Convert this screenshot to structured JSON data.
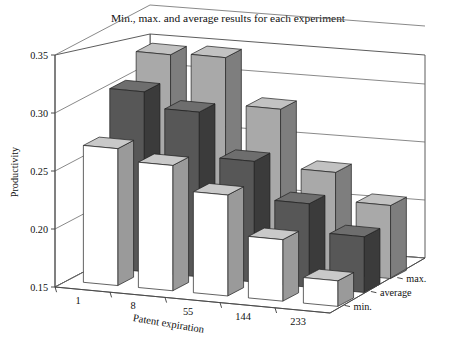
{
  "chart_data": {
    "type": "bar",
    "title": "Min., max. and average results for each experiment",
    "xlabel": "Patent expiration",
    "ylabel": "Productivity",
    "zlabel": "",
    "categories": [
      "1",
      "8",
      "55",
      "144",
      "233"
    ],
    "ytick_labels": [
      "0.35",
      "0.30",
      "0.25",
      "0.20",
      "0.15"
    ],
    "ytick_values": [
      0.35,
      0.3,
      0.25,
      0.2,
      0.15
    ],
    "ylim": [
      0.15,
      0.35
    ],
    "grid": true,
    "legend_position": "right-depth-axis",
    "three_d": true,
    "series": [
      {
        "name": "min.",
        "color": "#ffffff",
        "values": [
          0.268,
          0.258,
          0.237,
          0.203,
          0.172
        ]
      },
      {
        "name": "average",
        "color": "#575757",
        "values": [
          0.305,
          0.292,
          0.254,
          0.222,
          0.198
        ]
      },
      {
        "name": "max.",
        "color": "#a9a9a9",
        "values": [
          0.325,
          0.327,
          0.287,
          0.237,
          0.213
        ]
      }
    ],
    "legend_entries": [
      "max.",
      "average",
      "min."
    ]
  },
  "colors": {
    "background": "#ffffff",
    "axis": "#4a4a4a",
    "grid": "#6b6b6b",
    "text": "#111111",
    "bar_min_front": "#ffffff",
    "bar_min_side": "#9a9a9a",
    "bar_min_top": "#c9c9c9",
    "bar_avg_front": "#575757",
    "bar_avg_side": "#3b3b3b",
    "bar_avg_top": "#6e6e6e",
    "bar_max_front": "#a9a9a9",
    "bar_max_side": "#7e7e7e",
    "bar_max_top": "#c2c2c2"
  }
}
